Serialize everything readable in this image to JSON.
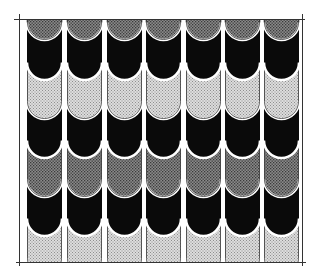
{
  "illustration": {
    "subject": "roof-tile-shingle-pattern",
    "columns": 7,
    "rows": [
      {
        "name": "row-1",
        "fill": "dark-dotted"
      },
      {
        "name": "row-2",
        "fill": "black"
      },
      {
        "name": "row-3",
        "fill": "light-dotted"
      },
      {
        "name": "row-4",
        "fill": "black"
      },
      {
        "name": "row-5",
        "fill": "dark-dotted"
      },
      {
        "name": "row-6",
        "fill": "black"
      },
      {
        "name": "row-7",
        "fill": "light-dotted"
      }
    ],
    "colors": {
      "black": "#0a0a0a",
      "dark_dotted_bg": "#8a8a8a",
      "dark_dotted_dot": "#3a3a3a",
      "light_dotted_bg": "#d8d8d8",
      "light_dotted_dot": "#9a9a9a",
      "frame": "#333333",
      "background": "#ffffff"
    }
  }
}
